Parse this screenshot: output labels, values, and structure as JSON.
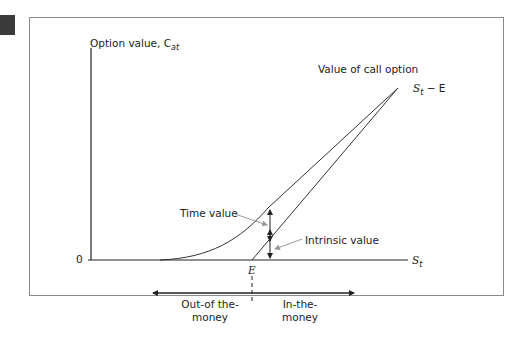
{
  "diagram": {
    "y_axis_label": "Option value, C",
    "y_axis_label_sub": "at",
    "origin_label": "0",
    "x_axis_label": "S",
    "x_axis_label_sub": "t",
    "strike_label": "E",
    "curve_title": "Value of call option",
    "line_label_s": "S",
    "line_label_sub": "t",
    "line_label_rest": " − E",
    "time_value_label": "Time value",
    "intrinsic_value_label": "Intrinsic value",
    "left_region_line1": "Out-of the-",
    "left_region_line2": "money",
    "right_region_line1": "In-the-",
    "right_region_line2": "money"
  },
  "colors": {
    "axis": "#222222",
    "frame": "#8a8a8a",
    "pointer": "#999999"
  }
}
